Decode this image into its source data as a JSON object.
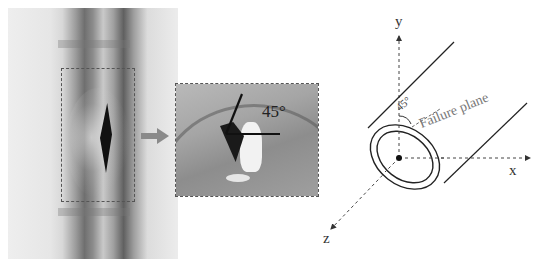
{
  "photo_panel": {
    "description": "Photograph of steel pipe with longitudinal burst crack",
    "highlight_box": "dash-dot selection around crack"
  },
  "arrow": {
    "icon": "right-arrow-icon",
    "color": "#8a8a8a"
  },
  "inset_panel": {
    "description": "Zoomed view of crack fracture surface",
    "angle_label": "45°"
  },
  "schematic": {
    "axes": {
      "x": "x",
      "y": "y",
      "z": "z"
    },
    "angle_label": "45°",
    "failure_plane_label": "Failure plane"
  },
  "colors": {
    "line": "#222222",
    "dashed_axis": "#444444",
    "label_gray": "#777777"
  }
}
